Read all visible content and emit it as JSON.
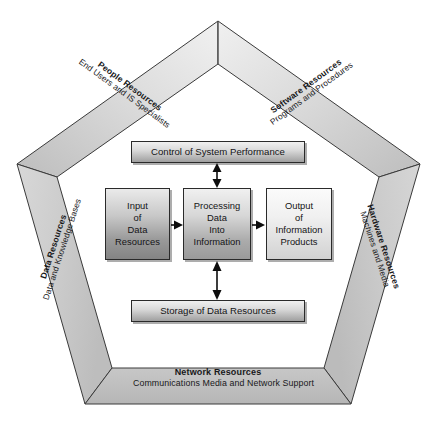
{
  "diagram": {
    "frame": {
      "people": {
        "title": "People Resources",
        "subtitle": "End Users and IS Specialists"
      },
      "software": {
        "title": "Software Resources",
        "subtitle": "Programs and Procedures"
      },
      "data": {
        "title": "Data Resources",
        "subtitle": "Data and Knowledge Bases"
      },
      "hardware": {
        "title": "Hardware Resources",
        "subtitle": "Machines and Media"
      },
      "network": {
        "title": "Network Resources",
        "subtitle": "Communications Media and Network Support"
      }
    },
    "boxes": {
      "control": {
        "label": "Control of System Performance"
      },
      "storage": {
        "label": "Storage of Data Resources"
      },
      "input": {
        "lines": [
          "Input",
          "of",
          "Data",
          "Resources"
        ]
      },
      "processing": {
        "lines": [
          "Processing",
          "Data",
          "Into",
          "Information"
        ]
      },
      "output": {
        "lines": [
          "Output",
          "of",
          "Information",
          "Products"
        ]
      }
    },
    "connectors": [
      {
        "name": "input-to-processing",
        "type": "arrow-right"
      },
      {
        "name": "processing-to-output",
        "type": "arrow-right"
      },
      {
        "name": "control-to-processing",
        "type": "arrow-double-vertical"
      },
      {
        "name": "processing-to-storage",
        "type": "arrow-double-vertical"
      }
    ],
    "colors": {
      "frame_fill_light": "#e2e2e2",
      "frame_fill_mid": "#c9c9c9",
      "frame_fill_dark": "#b4b4b4",
      "outline": "#3a3a3a",
      "text": "#18181a",
      "box_border": "#2a2a2a"
    }
  }
}
